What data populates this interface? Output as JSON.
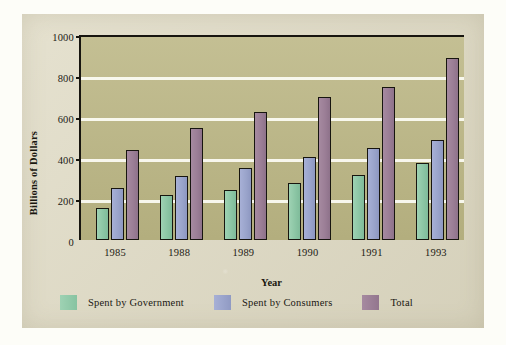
{
  "chart_data": {
    "type": "bar",
    "title": "",
    "xlabel": "Year",
    "ylabel": "Billions of Dollars",
    "categories": [
      "1985",
      "1988",
      "1989",
      "1990",
      "1991",
      "1993"
    ],
    "series": [
      {
        "name": "Spent by Government",
        "color": "#8cc6a5",
        "values": [
          155,
          220,
          245,
          280,
          315,
          375
        ]
      },
      {
        "name": "Spent by Consumers",
        "color": "#9aa4cb",
        "values": [
          255,
          310,
          350,
          405,
          450,
          490
        ]
      },
      {
        "name": "Total",
        "color": "#9b7e96",
        "values": [
          440,
          545,
          625,
          700,
          745,
          890
        ]
      }
    ],
    "ylim": [
      0,
      1000
    ],
    "yticks": [
      0,
      200,
      400,
      600,
      800,
      1000
    ],
    "ytick_labels": [
      "0",
      "200",
      "400",
      "600",
      "800",
      "1000"
    ],
    "grid": true,
    "grid_color": "#fbfbf2",
    "legend_position": "bottom",
    "plot_background": "#bdb887",
    "panel_background": "#ded9c2",
    "axis_color": "#17150f"
  }
}
